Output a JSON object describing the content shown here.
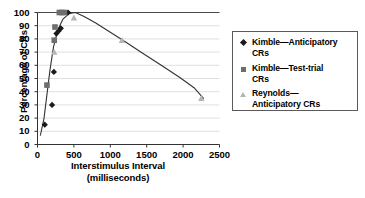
{
  "chart_data": {
    "type": "scatter",
    "title": "",
    "xlabel": "Interstimulus Interval",
    "xlabel_units": "(milliseconds)",
    "ylabel": "Percentage of CRs",
    "xlim": [
      0,
      2500
    ],
    "ylim": [
      0,
      100
    ],
    "xticks": [
      0,
      500,
      1000,
      1500,
      2000,
      2500
    ],
    "yticks": [
      0,
      10,
      20,
      30,
      40,
      50,
      60,
      70,
      80,
      90,
      100
    ],
    "grid": "horizontal",
    "legend_position": "right",
    "series": [
      {
        "name": "Kimble—Anticipatory CRs",
        "marker": "diamond",
        "color": "#1a1a1a",
        "points": [
          {
            "x": 100,
            "y": 15
          },
          {
            "x": 200,
            "y": 30
          },
          {
            "x": 225,
            "y": 55
          },
          {
            "x": 260,
            "y": 84
          },
          {
            "x": 290,
            "y": 86
          },
          {
            "x": 320,
            "y": 88
          },
          {
            "x": 420,
            "y": 100
          }
        ]
      },
      {
        "name": "Kimble—Test-trial CRs",
        "marker": "square",
        "color": "#6e6e6e",
        "points": [
          {
            "x": 130,
            "y": 45
          },
          {
            "x": 230,
            "y": 79
          },
          {
            "x": 240,
            "y": 89
          },
          {
            "x": 300,
            "y": 100
          },
          {
            "x": 335,
            "y": 100
          },
          {
            "x": 370,
            "y": 100
          }
        ]
      },
      {
        "name": "Reynolds—Anticipatory CRs",
        "marker": "triangle",
        "color": "#b5b5b5",
        "points": [
          {
            "x": 230,
            "y": 70
          },
          {
            "x": 500,
            "y": 96
          },
          {
            "x": 1160,
            "y": 79
          },
          {
            "x": 2250,
            "y": 35
          }
        ]
      }
    ],
    "fit_curve": {
      "name": "fitted-isi-function",
      "color": "#333333",
      "points": [
        {
          "x": 40,
          "y": 7
        },
        {
          "x": 90,
          "y": 20
        },
        {
          "x": 130,
          "y": 38
        },
        {
          "x": 170,
          "y": 56
        },
        {
          "x": 220,
          "y": 74
        },
        {
          "x": 280,
          "y": 87
        },
        {
          "x": 350,
          "y": 95
        },
        {
          "x": 430,
          "y": 99
        },
        {
          "x": 520,
          "y": 100
        },
        {
          "x": 640,
          "y": 97
        },
        {
          "x": 800,
          "y": 92
        },
        {
          "x": 1000,
          "y": 85
        },
        {
          "x": 1200,
          "y": 78
        },
        {
          "x": 1450,
          "y": 69
        },
        {
          "x": 1700,
          "y": 60
        },
        {
          "x": 1950,
          "y": 51
        },
        {
          "x": 2150,
          "y": 43
        },
        {
          "x": 2280,
          "y": 35
        }
      ]
    }
  },
  "legend": {
    "items": [
      {
        "marker": "diamond",
        "line1": "Kimble—Anticipatory",
        "line2": "CRs"
      },
      {
        "marker": "square",
        "line1": "Kimble—Test-trial",
        "line2": "CRs"
      },
      {
        "marker": "triangle",
        "line1": "Reynolds—",
        "line2": "Anticipatory CRs"
      }
    ]
  },
  "axis": {
    "y_title": "Percentage of CRs",
    "x_title_line1": "Interstimulus Interval",
    "x_title_line2": "(milliseconds)",
    "y_ticks": [
      "100",
      "90",
      "80",
      "70",
      "60",
      "50",
      "40",
      "30",
      "20",
      "10",
      "0"
    ],
    "x_ticks": [
      "0",
      "500",
      "1000",
      "1500",
      "2000",
      "2500"
    ]
  }
}
